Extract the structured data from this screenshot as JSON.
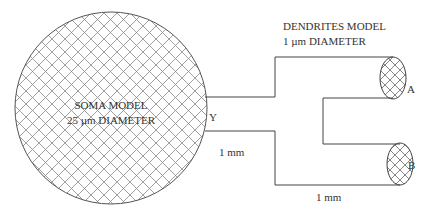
{
  "diagram": {
    "soma": {
      "line1": "SOMA MODEL",
      "line2": "25 µm DIAMETER"
    },
    "dendrites": {
      "line1": "DENDRITES MODEL",
      "line2": "1 µm DIAMETER"
    },
    "junction_label": "Y",
    "branch_a_label": "A",
    "branch_b_label": "B",
    "trunk_length": "1 mm",
    "branch_length": "1 mm"
  },
  "colors": {
    "stroke": "#444444",
    "hatch": "#777777",
    "text": "#333333"
  }
}
